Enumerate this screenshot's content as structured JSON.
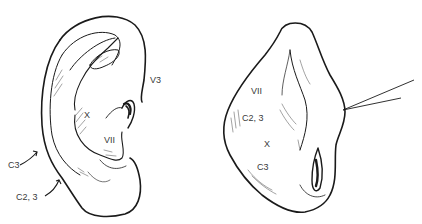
{
  "figure": {
    "left_panel": {
      "view": "lateral ear",
      "labels": {
        "v3": "V3",
        "x": "X",
        "vii": "VII",
        "c3": "C3",
        "c23": "C2, 3"
      }
    },
    "right_panel": {
      "view": "posterior ear",
      "labels": {
        "vii": "VII",
        "c23": "C2, 3",
        "x": "X",
        "c3": "C3"
      }
    },
    "colors": {
      "ink": "#1a1a1a",
      "background": "#ffffff"
    }
  }
}
